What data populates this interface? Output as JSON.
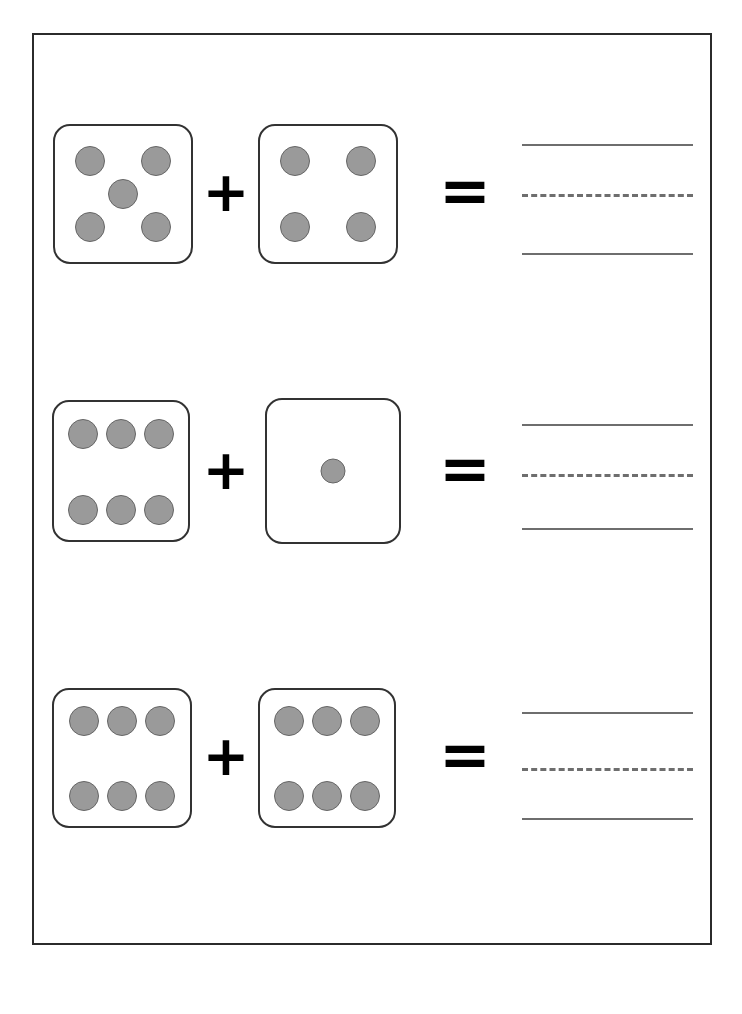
{
  "page": {
    "width": 742,
    "height": 1014,
    "background_color": "#ffffff",
    "frame_color": "#2b2b2b"
  },
  "worksheet": {
    "type": "dice-addition-worksheet",
    "operator_plus": "+",
    "operator_equals": "=",
    "colors": {
      "die_fill": "#ffffff",
      "die_border": "#323232",
      "pip_fill": "#9a9a9a",
      "pip_border": "#666666",
      "operator": "#000000",
      "writing_line": "#6e6e6e"
    },
    "answer_lines": {
      "top_style": "solid",
      "middle_style": "dashed",
      "bottom_style": "solid",
      "count": 3
    },
    "problems": [
      {
        "index": 1,
        "addend_1": 5,
        "addend_2": 4,
        "sum": 9,
        "answer_value": "",
        "die_a": {
          "pip_count": 5,
          "pips": [
            {
              "x": 26,
              "y": 26
            },
            {
              "x": 74,
              "y": 26
            },
            {
              "x": 50,
              "y": 50
            },
            {
              "x": 26,
              "y": 74
            },
            {
              "x": 74,
              "y": 74
            }
          ]
        },
        "die_b": {
          "pip_count": 4,
          "pips": [
            {
              "x": 26,
              "y": 26
            },
            {
              "x": 74,
              "y": 26
            },
            {
              "x": 26,
              "y": 74
            },
            {
              "x": 74,
              "y": 74
            }
          ]
        }
      },
      {
        "index": 2,
        "addend_1": 6,
        "addend_2": 1,
        "sum": 7,
        "answer_value": "",
        "die_a": {
          "pip_count": 6,
          "pips": [
            {
              "x": 22,
              "y": 23
            },
            {
              "x": 50,
              "y": 23
            },
            {
              "x": 78,
              "y": 23
            },
            {
              "x": 22,
              "y": 78
            },
            {
              "x": 50,
              "y": 78
            },
            {
              "x": 78,
              "y": 78
            }
          ]
        },
        "die_b": {
          "pip_count": 1,
          "pips": [
            {
              "x": 50,
              "y": 50
            }
          ]
        }
      },
      {
        "index": 3,
        "addend_1": 6,
        "addend_2": 6,
        "sum": 12,
        "answer_value": "",
        "die_a": {
          "pip_count": 6,
          "pips": [
            {
              "x": 22,
              "y": 23
            },
            {
              "x": 50,
              "y": 23
            },
            {
              "x": 78,
              "y": 23
            },
            {
              "x": 22,
              "y": 78
            },
            {
              "x": 50,
              "y": 78
            },
            {
              "x": 78,
              "y": 78
            }
          ]
        },
        "die_b": {
          "pip_count": 6,
          "pips": [
            {
              "x": 22,
              "y": 23
            },
            {
              "x": 50,
              "y": 23
            },
            {
              "x": 78,
              "y": 23
            },
            {
              "x": 22,
              "y": 78
            },
            {
              "x": 50,
              "y": 78
            },
            {
              "x": 78,
              "y": 78
            }
          ]
        }
      }
    ]
  }
}
